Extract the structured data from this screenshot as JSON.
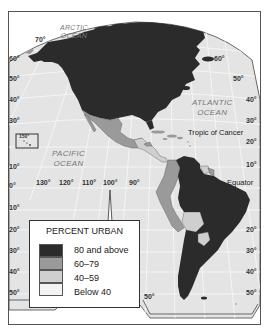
{
  "map": {
    "title": "Percent Urban — Western Hemisphere",
    "colors": {
      "urban_80_above": "#2b2b2b",
      "urban_60_79": "#9a9a9a",
      "urban_40_59": "#cfcfcf",
      "urban_below_40": "#f3f3f3",
      "ocean": "#e4e4e4",
      "frame": "#555555"
    },
    "oceans": {
      "arctic": "ARCTIC\nOCEAN",
      "arctic_line1": "ARCTIC",
      "arctic_line2": "OCEAN",
      "atlantic_line1": "ATLANTIC",
      "atlantic_line2": "OCEAN",
      "pacific_line1": "PACIFIC",
      "pacific_line2": "OCEAN"
    },
    "features": {
      "tropic_of_cancer": "Tropic of Cancer",
      "equator": "Equator"
    },
    "latitude_labels_left": [
      "60°",
      "50°",
      "40°",
      "30°",
      "20°",
      "10°",
      "0°",
      "10°",
      "20°",
      "30°",
      "40°",
      "50°"
    ],
    "latitude_labels_right": [
      "60°",
      "50°",
      "40°",
      "30°",
      "20°",
      "10°",
      "20°",
      "30°",
      "40°",
      "50°"
    ],
    "top_labels": [
      "70°"
    ],
    "longitude_labels": [
      "130°",
      "120°",
      "110°",
      "100°",
      "90°"
    ],
    "inset_label": "150°",
    "bottom_labels": [
      "50°",
      "50°"
    ]
  },
  "legend": {
    "title": "PERCENT URBAN",
    "items": [
      {
        "label": "80 and above",
        "color": "#2b2b2b"
      },
      {
        "label": "60–79",
        "color": "#9a9a9a"
      },
      {
        "label": "40–59",
        "color": "#cfcfcf"
      },
      {
        "label": "Below 40",
        "color": "#f3f3f3"
      }
    ]
  }
}
